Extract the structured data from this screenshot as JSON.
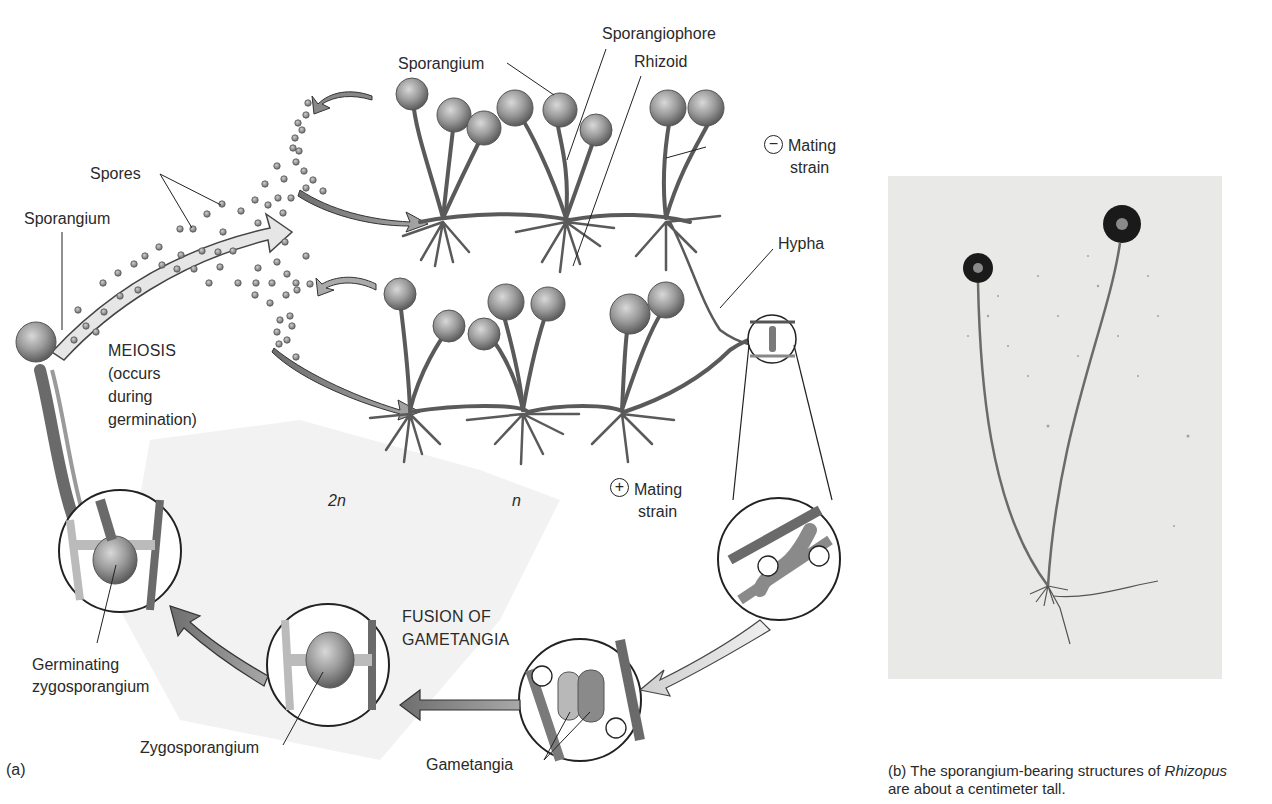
{
  "figure": {
    "panel_a": {
      "tag": "(a)",
      "labels": {
        "sporangium_top": "Sporangium",
        "sporangiophore": "Sporangiophore",
        "rhizoid": "Rhizoid",
        "minus_strain_symbol": "−",
        "minus_strain_line1": "Mating",
        "minus_strain_line2": "strain",
        "hypha": "Hypha",
        "spores": "Spores",
        "sporangium_left": "Sporangium",
        "meiosis_line1": "MEIOSIS",
        "meiosis_line2": "(occurs",
        "meiosis_line3": "during",
        "meiosis_line4": "germination)",
        "ploidy_diploid": "2n",
        "ploidy_haploid": "n",
        "plus_strain_symbol": "+",
        "plus_strain_line1": "Mating",
        "plus_strain_line2": "strain",
        "fusion_line1": "FUSION OF",
        "fusion_line2": "GAMETANGIA",
        "germinating_line1": "Germinating",
        "germinating_line2": "zygosporangium",
        "zygosporangium": "Zygosporangium",
        "gametangia": "Gametangia",
        "plus_sign": "+",
        "minus_sign": "−"
      }
    },
    "panel_b": {
      "tag": "(b)",
      "caption_line1_pre": "The sporangium-bearing structures of ",
      "caption_line1_genus": "Rhizopus",
      "caption_line2": "are about a centimeter tall."
    },
    "colors": {
      "ink": "#231f20",
      "fungus_gray": "#7a7a7a",
      "diploid_shade": "#efefef",
      "photo_bg": "#e9e9e7"
    }
  }
}
